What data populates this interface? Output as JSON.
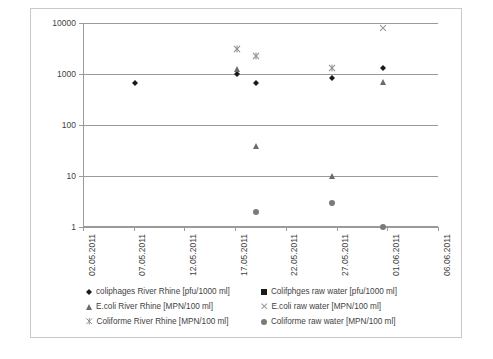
{
  "chart_data": {
    "type": "scatter",
    "title": "",
    "xlabel": "",
    "ylabel": "",
    "yscale": "log",
    "ylim": [
      1,
      10000
    ],
    "grid": true,
    "legend_position": "bottom",
    "y_ticks": [
      "10000",
      "1000",
      "100",
      "10",
      "1"
    ],
    "y_tick_values": [
      10000,
      1000,
      100,
      10,
      1
    ],
    "x_ticks": [
      "02.05.2011",
      "07.05.2011",
      "12.05.2011",
      "17.05.2011",
      "22.05.2011",
      "27.05.2011",
      "01.06.2011",
      "06.06.2011"
    ],
    "x_tick_values": [
      0,
      5,
      10,
      15,
      20,
      25,
      30,
      35
    ],
    "xlim": [
      0,
      35
    ],
    "colors": {
      "coliphages_river": "#1a1a1a",
      "coliphages_raw": "#1a1a1a",
      "ecoli_river": "#6b6b6b",
      "ecoli_raw": "#9c9c9c",
      "coliforme_river": "#8f8f8f",
      "coliforme_raw": "#7a7a7a",
      "grid": "#9a9a9a",
      "axis": "#9a9a9a",
      "border": "#c9c9c9",
      "text": "#3f3f3f"
    },
    "series": [
      {
        "name": "coliphages River Rhine [pfu/1000 ml]",
        "marker": "diamond",
        "color": "#1a1a1a",
        "points": [
          {
            "x": 5.1,
            "y": 680
          },
          {
            "x": 15.2,
            "y": 1000
          },
          {
            "x": 17.1,
            "y": 680
          },
          {
            "x": 24.5,
            "y": 850
          },
          {
            "x": 29.6,
            "y": 1300
          }
        ]
      },
      {
        "name": "Colifphges raw water [pfu/1000 ml]",
        "marker": "square",
        "color": "#1a1a1a",
        "points": []
      },
      {
        "name": "E.coli River Rhine [MPN/100 ml]",
        "marker": "triangle",
        "color": "#6b6b6b",
        "points": [
          {
            "x": 15.2,
            "y": 1250
          },
          {
            "x": 17.1,
            "y": 38
          },
          {
            "x": 24.5,
            "y": 10
          },
          {
            "x": 29.6,
            "y": 700
          }
        ]
      },
      {
        "name": "E.coli raw water [MPN/100 ml]",
        "marker": "x",
        "color": "#9c9c9c",
        "points": [
          {
            "x": 29.6,
            "y": 8000
          }
        ]
      },
      {
        "name": "Coliforme River Rhine [MPN/100 ml]",
        "marker": "asterisk",
        "color": "#8f8f8f",
        "points": [
          {
            "x": 15.2,
            "y": 3100
          },
          {
            "x": 17.1,
            "y": 2300
          },
          {
            "x": 24.5,
            "y": 1300
          }
        ]
      },
      {
        "name": "Coliforme raw water [MPN/100 ml]",
        "marker": "circle",
        "color": "#7a7a7a",
        "points": [
          {
            "x": 17.1,
            "y": 2
          },
          {
            "x": 24.5,
            "y": 3
          },
          {
            "x": 29.6,
            "y": 1
          }
        ]
      }
    ]
  },
  "legend": {
    "items": [
      {
        "label": "coliphages River Rhine [pfu/1000 ml]",
        "marker": "diamond",
        "color": "#1a1a1a"
      },
      {
        "label": "Colifphges raw water [pfu/1000 ml]",
        "marker": "square",
        "color": "#1a1a1a"
      },
      {
        "label": "E.coli River Rhine [MPN/100 ml]",
        "marker": "triangle",
        "color": "#6b6b6b"
      },
      {
        "label": "E.coli raw water [MPN/100 ml]",
        "marker": "x",
        "color": "#9c9c9c"
      },
      {
        "label": "Coliforme River Rhine [MPN/100 ml]",
        "marker": "asterisk",
        "color": "#8f8f8f"
      },
      {
        "label": "Coliforme raw water [MPN/100 ml]",
        "marker": "circle",
        "color": "#7a7a7a"
      }
    ]
  }
}
